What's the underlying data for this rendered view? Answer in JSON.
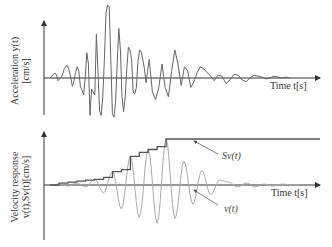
{
  "chart_data": [
    {
      "type": "line",
      "title": "",
      "ylabel_line1": "Acceleration y(t)",
      "ylabel_line2": "[cm/s]",
      "xlabel": "Time t[s]",
      "grid": false,
      "series": [
        {
          "name": "y(t)",
          "color": "#666666",
          "x": [
            0,
            4,
            6,
            8,
            10,
            12,
            15,
            18,
            20,
            22,
            24,
            26,
            28,
            30,
            32,
            34,
            36,
            38,
            40,
            42,
            44,
            46,
            48,
            50,
            52,
            54,
            56,
            58,
            60,
            62,
            64,
            66,
            68,
            70,
            72,
            74,
            76,
            78,
            80,
            82,
            84,
            86,
            88,
            90,
            92,
            94,
            96,
            98,
            100,
            102,
            104,
            106,
            108,
            110,
            112,
            114,
            116,
            118,
            120,
            124,
            128,
            132,
            136,
            140,
            144,
            148,
            152,
            156,
            160,
            164,
            168,
            172,
            176,
            180,
            184,
            188,
            192,
            196,
            200,
            205,
            210,
            215,
            220,
            225,
            230,
            235,
            240,
            245,
            250,
            255,
            260,
            265,
            270,
            275,
            280,
            285,
            290,
            295,
            300
          ],
          "values": [
            0,
            4,
            5,
            4,
            -3,
            -1,
            2,
            10,
            13,
            13,
            8,
            0,
            -9,
            -3,
            6,
            12,
            7,
            -9,
            -13,
            -18,
            0,
            27,
            15,
            -40,
            -12,
            -15,
            -18,
            47,
            6,
            -35,
            -40,
            -20,
            20,
            70,
            78,
            76,
            20,
            -38,
            -42,
            -25,
            15,
            53,
            30,
            -20,
            -36,
            -20,
            10,
            33,
            30,
            20,
            -15,
            -17,
            -10,
            18,
            30,
            28,
            20,
            10,
            -5,
            20,
            -15,
            -23,
            -10,
            15,
            -10,
            -20,
            7,
            30,
            15,
            -8,
            12,
            8,
            -10,
            -4,
            6,
            12,
            10,
            6,
            3,
            -3,
            3,
            2,
            -6,
            -2,
            4,
            3,
            -2,
            -4,
            0,
            3,
            2,
            1,
            -1,
            0,
            2,
            1,
            0,
            1,
            0
          ],
          "note": "Earthquake ground acceleration record; values are relative amplitudes (arbitrary units), no numeric ticks shown"
        }
      ]
    },
    {
      "type": "line",
      "title": "",
      "ylabel_line1": "Velocity response",
      "ylabel_line2": "v(t),Sv(t)[cm/s]",
      "xlabel": "Time t[s]",
      "grid": false,
      "annotations": [
        "Sv(t)",
        "v(t)"
      ],
      "series": [
        {
          "name": "Sv(t)",
          "color": "#555555",
          "description": "Monotonically increasing envelope (step function) of |v(t)|, reaching its maximum around the strongest shaking and staying constant afterwards",
          "x": [
            0,
            10,
            20,
            30,
            40,
            50,
            60,
            70,
            80,
            90,
            100,
            110,
            120,
            130,
            140,
            150,
            160,
            170,
            180,
            190,
            200,
            210,
            220,
            230,
            240,
            250,
            260,
            270,
            280
          ],
          "values": [
            0,
            2,
            3,
            4,
            5,
            6,
            8,
            14,
            16,
            30,
            34,
            37,
            40,
            48,
            48,
            48,
            48,
            48,
            48,
            48,
            48,
            48,
            48,
            48,
            48,
            48,
            48,
            48,
            48
          ]
        },
        {
          "name": "v(t)",
          "color": "#aaaaaa",
          "description": "Oscillating velocity response, amplitude grows then decays",
          "x": [
            0,
            10,
            20,
            30,
            40,
            50,
            60,
            70,
            80,
            90,
            100,
            110,
            120,
            130,
            140,
            150,
            160,
            170,
            180,
            190,
            200,
            210,
            220,
            230,
            240,
            250,
            260,
            270,
            280
          ],
          "values": [
            0,
            1,
            -1,
            2,
            -2,
            6,
            -8,
            14,
            -25,
            30,
            -34,
            37,
            -40,
            48,
            -35,
            25,
            -20,
            15,
            -10,
            5,
            3,
            -2,
            2,
            -2,
            1,
            -1,
            1,
            0,
            0
          ]
        }
      ]
    }
  ],
  "top": {
    "ylabel_line1": "Acceleration y(t)",
    "ylabel_line2": "[cm/s]",
    "xlabel": "Time t[s]"
  },
  "bottom": {
    "ylabel_line1": "Velocity response",
    "ylabel_line2": "v(t),Sv(t)[cm/s]",
    "xlabel": "Time t[s]",
    "annot_sv": "Sv(t)",
    "annot_v": "v(t)"
  }
}
